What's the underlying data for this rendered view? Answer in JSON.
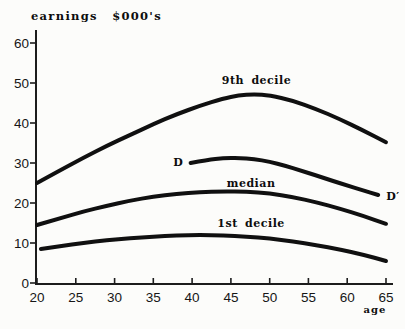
{
  "figure": {
    "background": "#fcfcfa",
    "ink": "#101010"
  },
  "chart_data": {
    "type": "line",
    "title": "earnings $000's",
    "xlabel": "age",
    "ylabel": "",
    "xlim": [
      20,
      65
    ],
    "ylim": [
      0,
      60
    ],
    "x_ticks": [
      20,
      25,
      30,
      35,
      40,
      45,
      50,
      55,
      60,
      65
    ],
    "y_ticks": [
      0,
      10,
      20,
      30,
      40,
      50,
      60
    ],
    "grid": false,
    "legend_position": "inline-curve-labels",
    "series": [
      {
        "name": "9th-decile",
        "points": [
          [
            20,
            25
          ],
          [
            23,
            28.2
          ],
          [
            26,
            31.3
          ],
          [
            29,
            34.3
          ],
          [
            32,
            37
          ],
          [
            35,
            39.7
          ],
          [
            38,
            42.2
          ],
          [
            41,
            44.3
          ],
          [
            44,
            46.1
          ],
          [
            46,
            46.9
          ],
          [
            48,
            47.2
          ],
          [
            50,
            46.9
          ],
          [
            53,
            45.6
          ],
          [
            56,
            43.5
          ],
          [
            59,
            41
          ],
          [
            62,
            38.2
          ],
          [
            65,
            35.2
          ]
        ],
        "labels": [
          {
            "text": "9th decile",
            "x": 48.3,
            "y": 50.6
          }
        ]
      },
      {
        "name": "cohort-D",
        "points": [
          [
            39.8,
            30
          ],
          [
            42,
            30.8
          ],
          [
            44,
            31.2
          ],
          [
            46,
            31.3
          ],
          [
            48,
            31
          ],
          [
            50,
            30.3
          ],
          [
            52,
            29.3
          ],
          [
            54,
            28.1
          ],
          [
            56,
            26.9
          ],
          [
            58,
            25.6
          ],
          [
            60,
            24.4
          ],
          [
            62,
            23.2
          ],
          [
            64,
            22
          ]
        ],
        "labels": [
          {
            "text": "D",
            "x": 38.2,
            "y": 30.2
          },
          {
            "text": "D′",
            "x": 65.9,
            "y": 21.6
          }
        ]
      },
      {
        "name": "median",
        "points": [
          [
            20,
            14.5
          ],
          [
            23,
            16.2
          ],
          [
            26,
            17.9
          ],
          [
            29,
            19.3
          ],
          [
            32,
            20.6
          ],
          [
            35,
            21.6
          ],
          [
            38,
            22.3
          ],
          [
            41,
            22.7
          ],
          [
            44,
            22.9
          ],
          [
            47,
            22.8
          ],
          [
            50,
            22.4
          ],
          [
            53,
            21.5
          ],
          [
            56,
            20.2
          ],
          [
            59,
            18.6
          ],
          [
            62,
            16.8
          ],
          [
            65,
            14.8
          ]
        ],
        "labels": [
          {
            "text": "median",
            "x": 47.6,
            "y": 24.8
          }
        ]
      },
      {
        "name": "1st-decile",
        "points": [
          [
            20.5,
            8.5
          ],
          [
            23,
            9.2
          ],
          [
            26,
            10
          ],
          [
            29,
            10.7
          ],
          [
            32,
            11.2
          ],
          [
            35,
            11.6
          ],
          [
            38,
            11.9
          ],
          [
            41,
            12
          ],
          [
            44,
            11.9
          ],
          [
            47,
            11.6
          ],
          [
            50,
            11.1
          ],
          [
            53,
            10.4
          ],
          [
            56,
            9.5
          ],
          [
            59,
            8.4
          ],
          [
            62,
            7.1
          ],
          [
            65,
            5.5
          ]
        ],
        "labels": [
          {
            "text": "1st decile",
            "x": 47.6,
            "y": 14.8
          }
        ]
      }
    ]
  }
}
